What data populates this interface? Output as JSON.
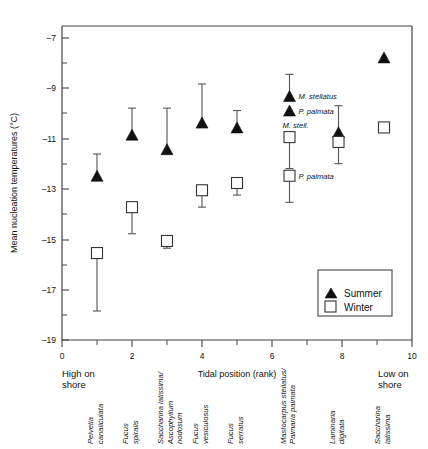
{
  "chart_data": {
    "type": "scatter",
    "title": "",
    "xlabel": "Tidal position (rank)",
    "ylabel": "Mean nucleation temperatures (°C)",
    "xlim": [
      0,
      10
    ],
    "ylim": [
      -19,
      -6
    ],
    "x_ticks": [
      0,
      2,
      4,
      6,
      8,
      10
    ],
    "x_tick_labels": [
      "0",
      "2",
      "4",
      "6",
      "8",
      "10"
    ],
    "x_minor_ticks": [
      1,
      3,
      5,
      7,
      9
    ],
    "y_ticks": [
      -7,
      -9,
      -11,
      -13,
      -15,
      -17,
      -19
    ],
    "y_tick_labels": [
      "–7",
      "–9",
      "–11",
      "–13",
      "–15",
      "–17",
      "–19"
    ],
    "y_minor_ticks": [
      -8,
      -10,
      -12,
      -14,
      -16,
      -18
    ],
    "grid": false,
    "axis_end_labels": {
      "left": "High on shore",
      "left_line1": "High on",
      "left_line2": "shore",
      "right": "Low on shore",
      "right_line1": "Low on",
      "right_line2": "shore"
    },
    "legend": {
      "position": "lower-right-inside",
      "entries": [
        {
          "name": "Summer",
          "marker": "filled-triangle",
          "color": "#111111"
        },
        {
          "name": "Winter",
          "marker": "open-square",
          "color": "#ffffff"
        }
      ]
    },
    "series": [
      {
        "name": "Summer",
        "marker": "filled-triangle",
        "points": [
          {
            "x": 1,
            "y": -12.2,
            "err_high": -11.3,
            "err_low": -12.2,
            "label": ""
          },
          {
            "x": 2,
            "y": -10.5,
            "err_high": -9.4,
            "err_low": -10.5,
            "label": ""
          },
          {
            "x": 3,
            "y": -11.1,
            "err_high": -9.4,
            "err_low": -11.1,
            "label": ""
          },
          {
            "x": 4,
            "y": -10.0,
            "err_high": -8.4,
            "err_low": -10.0,
            "label": ""
          },
          {
            "x": 5,
            "y": -10.2,
            "err_high": -9.5,
            "err_low": -10.2,
            "label": ""
          },
          {
            "x": 6.5,
            "y": -8.9,
            "err_high": -8.0,
            "err_low": -8.9,
            "label": "M. stellatus"
          },
          {
            "x": 6.5,
            "y": -9.5,
            "err_high": -9.5,
            "err_low": -9.5,
            "label": "P. palmata"
          },
          {
            "x": 7.9,
            "y": -10.4,
            "err_high": -9.3,
            "err_low": -10.4,
            "label": ""
          },
          {
            "x": 9.2,
            "y": -7.3,
            "err_high": -7.3,
            "err_low": -7.3,
            "label": ""
          }
        ]
      },
      {
        "name": "Winter",
        "marker": "open-square",
        "points": [
          {
            "x": 1,
            "y": -15.4,
            "err_high": -15.4,
            "err_low": -17.8,
            "label": ""
          },
          {
            "x": 2,
            "y": -13.5,
            "err_high": -13.5,
            "err_low": -14.6,
            "label": ""
          },
          {
            "x": 3,
            "y": -14.9,
            "err_high": -14.9,
            "err_low": -15.2,
            "label": ""
          },
          {
            "x": 4,
            "y": -12.8,
            "err_high": -12.8,
            "err_low": -13.5,
            "label": ""
          },
          {
            "x": 5,
            "y": -12.5,
            "err_high": -12.5,
            "err_low": -13.0,
            "label": ""
          },
          {
            "x": 6.5,
            "y": -10.6,
            "err_high": -10.6,
            "err_low": -11.9,
            "label": "M. stell."
          },
          {
            "x": 6.5,
            "y": -12.2,
            "err_high": -12.2,
            "err_low": -13.3,
            "label": "P. palmata"
          },
          {
            "x": 7.9,
            "y": -10.8,
            "err_high": -10.8,
            "err_low": -11.7,
            "label": ""
          },
          {
            "x": 9.2,
            "y": -10.2,
            "err_high": -10.2,
            "err_low": -10.2,
            "label": ""
          }
        ]
      }
    ],
    "species_labels": [
      {
        "x": 1,
        "lines": [
          "Pelvetia",
          "canaliculata"
        ]
      },
      {
        "x": 2,
        "lines": [
          "Fucus",
          "spiralis"
        ]
      },
      {
        "x": 3,
        "lines": [
          "Saccharina latissima/",
          "Ascophyllum",
          "nodosum"
        ]
      },
      {
        "x": 4,
        "lines": [
          "Fucus",
          "vesiculosus"
        ]
      },
      {
        "x": 5,
        "lines": [
          "Fucus",
          "serratus"
        ]
      },
      {
        "x": 6.5,
        "lines": [
          "Mastocarpus stellatus/",
          "Palmaria palmata"
        ]
      },
      {
        "x": 7.9,
        "lines": [
          "Laminaria",
          "digitata"
        ]
      },
      {
        "x": 9.2,
        "lines": [
          "Saccharina",
          "latissima"
        ]
      }
    ],
    "annotations": [
      {
        "text": "M. stellatus",
        "series": "Summer"
      },
      {
        "text": "P. palmata",
        "series": "Summer"
      },
      {
        "text": "M. stell.",
        "series": "Winter"
      },
      {
        "text": "P. palmata",
        "series": "Winter"
      }
    ]
  }
}
